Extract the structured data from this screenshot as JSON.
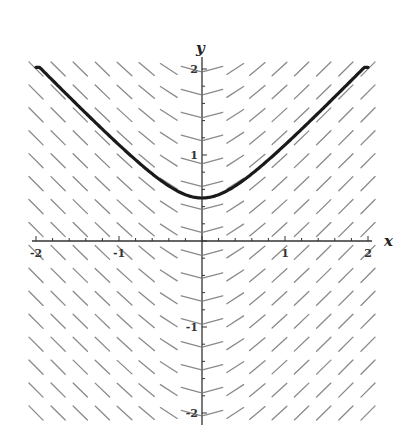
{
  "chart_data": {
    "type": "slope_field",
    "title": "",
    "xlabel": "x",
    "ylabel": "y",
    "xlim": [
      -2,
      2
    ],
    "ylim": [
      -2,
      2
    ],
    "x_ticks": [
      {
        "value": -2,
        "label": "-2"
      },
      {
        "value": -1,
        "label": "-1"
      },
      {
        "value": 1,
        "label": "1"
      },
      {
        "value": 2,
        "label": "2"
      }
    ],
    "y_ticks": [
      {
        "value": 2,
        "label": "2"
      },
      {
        "value": 1,
        "label": "1"
      },
      {
        "value": -1,
        "label": "-1"
      },
      {
        "value": -2,
        "label": "-2"
      }
    ],
    "minor_tick_step": 0.2,
    "grid": false,
    "field": {
      "description": "Slope depends only on x: dy/dx = x / sqrt(x^2 + 0.25)",
      "columns": 16,
      "rows": 16,
      "color": "#8a8a8a"
    },
    "solution_curve": {
      "description": "y = sqrt(x^2 + 0.25)",
      "min_point": [
        0,
        0.5
      ],
      "points": [
        [
          -2.0,
          2.06
        ],
        [
          -1.75,
          1.82
        ],
        [
          -1.5,
          1.58
        ],
        [
          -1.25,
          1.35
        ],
        [
          -1.0,
          1.12
        ],
        [
          -0.75,
          0.9
        ],
        [
          -0.5,
          0.71
        ],
        [
          -0.25,
          0.56
        ],
        [
          0.0,
          0.5
        ],
        [
          0.25,
          0.56
        ],
        [
          0.5,
          0.71
        ],
        [
          0.75,
          0.9
        ],
        [
          1.0,
          1.12
        ],
        [
          1.25,
          1.35
        ],
        [
          1.5,
          1.58
        ],
        [
          1.75,
          1.82
        ],
        [
          2.0,
          2.06
        ]
      ],
      "color": "#1a1a1a"
    }
  }
}
